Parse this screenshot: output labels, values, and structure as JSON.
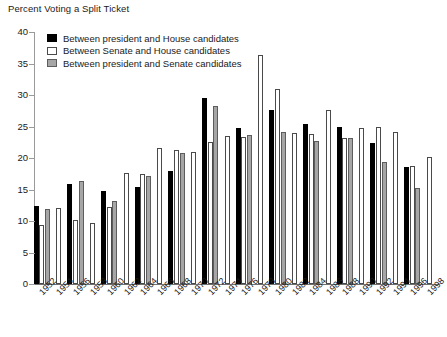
{
  "chart_data": {
    "type": "bar",
    "title": "Percent Voting a Split Ticket",
    "xlabel": "",
    "ylabel": "",
    "ylim": [
      0,
      40
    ],
    "yticks": [
      0,
      5,
      10,
      15,
      20,
      25,
      30,
      35,
      40
    ],
    "grid": false,
    "legend_position": "top-left-inside",
    "categories": [
      "1952",
      "1954",
      "1956",
      "1958",
      "1960",
      "1962",
      "1964",
      "1966",
      "1968",
      "1970",
      "1972",
      "1974",
      "1976",
      "1978",
      "1980",
      "1982",
      "1984",
      "1986",
      "1988",
      "1990",
      "1992",
      "1994",
      "1996",
      "1998"
    ],
    "series": [
      {
        "name": "Between president and House candidates",
        "color": "#000000",
        "values": [
          12.4,
          null,
          15.8,
          null,
          14.7,
          null,
          15.4,
          null,
          17.9,
          null,
          29.6,
          null,
          24.8,
          null,
          27.7,
          null,
          25.4,
          null,
          25.0,
          null,
          22.4,
          null,
          18.6,
          null
        ]
      },
      {
        "name": "Between Senate and House candidates",
        "color": "#ffffff",
        "values": [
          9.3,
          12.1,
          10.2,
          9.7,
          12.2,
          17.7,
          17.4,
          21.6,
          21.3,
          20.9,
          22.6,
          23.5,
          23.3,
          36.4,
          30.9,
          23.9,
          23.8,
          27.7,
          23.2,
          24.7,
          25.0,
          24.2,
          18.8,
          20.2
        ]
      },
      {
        "name": "Between president and Senate candidates",
        "color": "#a6a6a6",
        "values": [
          11.9,
          null,
          16.3,
          null,
          13.1,
          null,
          17.2,
          null,
          20.8,
          null,
          28.3,
          null,
          23.7,
          null,
          24.1,
          null,
          22.7,
          null,
          23.2,
          null,
          19.4,
          null,
          15.3,
          null
        ]
      }
    ]
  },
  "legend": {
    "items": [
      {
        "label": "Between president and House candidates",
        "swatch": "s0"
      },
      {
        "label": "Between Senate and House candidates",
        "swatch": "s1"
      },
      {
        "label": "Between president and Senate candidates",
        "swatch": "s2"
      }
    ]
  }
}
